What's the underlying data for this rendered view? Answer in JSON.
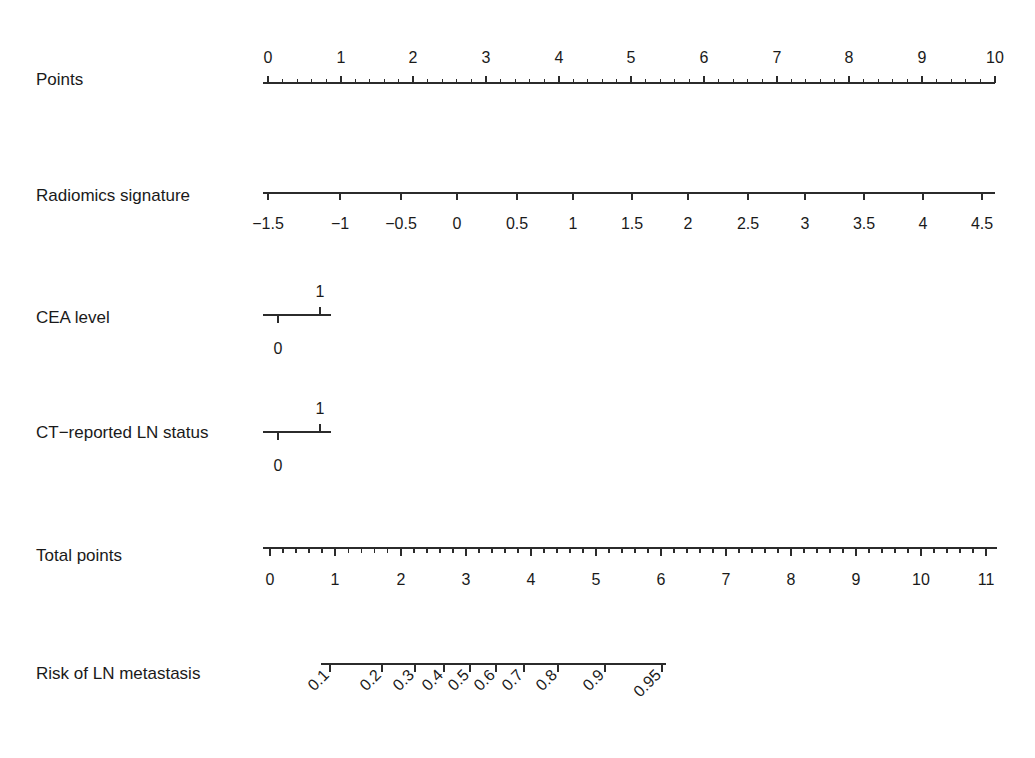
{
  "chart_data": {
    "type": "nomogram",
    "title": "",
    "subtitle": "",
    "xlabel": "",
    "ylabel": "",
    "grid": false,
    "legend": "none",
    "background_color": "#ffffff",
    "line_color": "#2b2b2b",
    "text_color": "#1a1a1a",
    "rows": [
      {
        "name": "points",
        "label": "Points",
        "label_y": 81,
        "axis_y": 83,
        "axis_x_start": 263,
        "axis_x_end": 995,
        "tick_direction": "up",
        "labels_position": "above",
        "label_offset": 20,
        "tick_major_len": 7,
        "tick_minor_len": 4,
        "minor_per_major": 5,
        "values": [
          0,
          1,
          2,
          3,
          4,
          5,
          6,
          7,
          8,
          9,
          10
        ],
        "tick_labels": [
          "0",
          "1",
          "2",
          "3",
          "4",
          "5",
          "6",
          "7",
          "8",
          "9",
          "10"
        ],
        "positions": [
          268,
          341,
          413,
          486,
          559,
          631,
          704,
          777,
          849,
          922,
          995
        ]
      },
      {
        "name": "radiomics-signature",
        "label": "Radiomics signature",
        "label_y": 197,
        "axis_y": 193,
        "axis_x_start": 263,
        "axis_x_end": 995,
        "tick_direction": "down",
        "labels_position": "below",
        "label_offset": 25,
        "tick_major_len": 7,
        "tick_minor_len": 0,
        "minor_per_major": 0,
        "values": [
          -1.5,
          -1,
          -0.5,
          0,
          0.5,
          1,
          1.5,
          2,
          2.5,
          3,
          3.5,
          4,
          4.5
        ],
        "tick_labels": [
          "−1.5",
          "−1",
          "−0.5",
          "0",
          "0.5",
          "1",
          "1.5",
          "2",
          "2.5",
          "3",
          "3.5",
          "4",
          "4.5"
        ],
        "positions": [
          268,
          340,
          401,
          457,
          517,
          573,
          632,
          688,
          748,
          805,
          864,
          923,
          982
        ]
      },
      {
        "name": "cea-level",
        "label": "CEA level",
        "label_y": 319,
        "axis_y": 315,
        "axis_x_start": 263,
        "axis_x_end": 331,
        "tick_direction": "split",
        "tick_major_len": 8,
        "points": [
          {
            "value": "0",
            "x": 278,
            "dir": "down",
            "label_offset": 28
          },
          {
            "value": "1",
            "x": 320,
            "dir": "up",
            "label_offset": 18
          }
        ]
      },
      {
        "name": "ct-reported-ln-status",
        "label": "CT−reported LN status",
        "label_y": 434,
        "axis_y": 432,
        "axis_x_start": 263,
        "axis_x_end": 331,
        "tick_direction": "split",
        "tick_major_len": 8,
        "points": [
          {
            "value": "0",
            "x": 278,
            "dir": "down",
            "label_offset": 28
          },
          {
            "value": "1",
            "x": 320,
            "dir": "up",
            "label_offset": 18
          }
        ]
      },
      {
        "name": "total-points",
        "label": "Total points",
        "label_y": 557,
        "axis_y": 548,
        "axis_x_start": 263,
        "axis_x_end": 997,
        "tick_direction": "down",
        "labels_position": "below",
        "label_offset": 26,
        "tick_major_len": 8,
        "tick_minor_len": 5,
        "minor_per_major": 5,
        "values": [
          0,
          1,
          2,
          3,
          4,
          5,
          6,
          7,
          8,
          9,
          10,
          11
        ],
        "tick_labels": [
          "0",
          "1",
          "2",
          "3",
          "4",
          "5",
          "6",
          "7",
          "8",
          "9",
          "10",
          "11"
        ],
        "positions": [
          270,
          335,
          401,
          466,
          531,
          596,
          661,
          726,
          791,
          856,
          921,
          986
        ]
      },
      {
        "name": "risk-of-ln-metastasis",
        "label": "Risk of LN metastasis",
        "label_y": 675,
        "axis_y": 664,
        "axis_x_start": 321,
        "axis_x_end": 666,
        "tick_direction": "down",
        "labels_position": "below-rotated",
        "label_rotation": -45,
        "label_offset": 12,
        "tick_major_len": 8,
        "tick_minor_len": 0,
        "minor_per_major": 0,
        "values": [
          0.1,
          0.2,
          0.3,
          0.4,
          0.5,
          0.6,
          0.7,
          0.8,
          0.9,
          0.95
        ],
        "tick_labels": [
          "0.1",
          "0.2",
          "0.3",
          "0.4",
          "0.5",
          "0.6",
          "0.7",
          "0.8",
          "0.9",
          "0.95"
        ],
        "positions": [
          330,
          382,
          415,
          444,
          470,
          496,
          524,
          558,
          605,
          662
        ]
      }
    ]
  },
  "labels": {
    "points": "Points",
    "radiomics_signature": "Radiomics signature",
    "cea_level": "CEA level",
    "ct_reported_ln_status": "CT−reported LN status",
    "total_points": "Total points",
    "risk_of_ln_metastasis": "Risk of LN metastasis"
  }
}
